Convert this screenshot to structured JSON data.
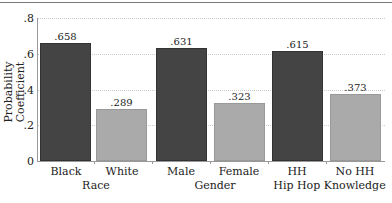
{
  "chart_data": {
    "type": "bar",
    "title": "",
    "xlabel": "",
    "ylabel": "Probability Coefficient",
    "ylim": [
      0,
      0.8
    ],
    "yticks": [
      "0",
      ".2",
      ".4",
      ".6",
      ".8"
    ],
    "grid": true,
    "categories": [
      "Black",
      "White",
      "Male",
      "Female",
      "HH",
      "No HH"
    ],
    "groups": [
      "Race",
      "Gender",
      "Hip Hop Knowledge"
    ],
    "values": [
      0.658,
      0.289,
      0.631,
      0.323,
      0.615,
      0.373
    ],
    "value_labels": [
      ".658",
      ".289",
      ".631",
      ".323",
      ".615",
      ".373"
    ],
    "colors": {
      "dark": "#444444",
      "light": "#aaaaaa"
    }
  }
}
